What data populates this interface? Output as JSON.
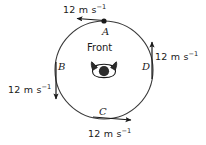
{
  "figure": {
    "type": "circular-motion-diagram",
    "colors": {
      "stroke": "#1a1a1a",
      "background": "#ffffff",
      "figure_fill": "#2b2b2b"
    },
    "circle": {
      "center_x": 104,
      "center_y": 70,
      "radius": 49
    },
    "center_icon": {
      "label": "Front",
      "name": "person-front-view-icon"
    },
    "points": [
      {
        "id": "A",
        "label": "A",
        "position": "top",
        "marker": "filled-dot",
        "velocity_label": "12 m s",
        "velocity_exponent": "−1",
        "arrow_direction": "left"
      },
      {
        "id": "B",
        "label": "B",
        "position": "left",
        "marker": "none",
        "velocity_label": "12 m s",
        "velocity_exponent": "−1",
        "arrow_direction": "down"
      },
      {
        "id": "C",
        "label": "C",
        "position": "bottom",
        "marker": "none",
        "velocity_label": "12 m s",
        "velocity_exponent": "−1",
        "arrow_direction": "right"
      },
      {
        "id": "D",
        "label": "D",
        "position": "right",
        "marker": "none",
        "velocity_label": "12 m s",
        "velocity_exponent": "−1",
        "arrow_direction": "up"
      }
    ]
  }
}
